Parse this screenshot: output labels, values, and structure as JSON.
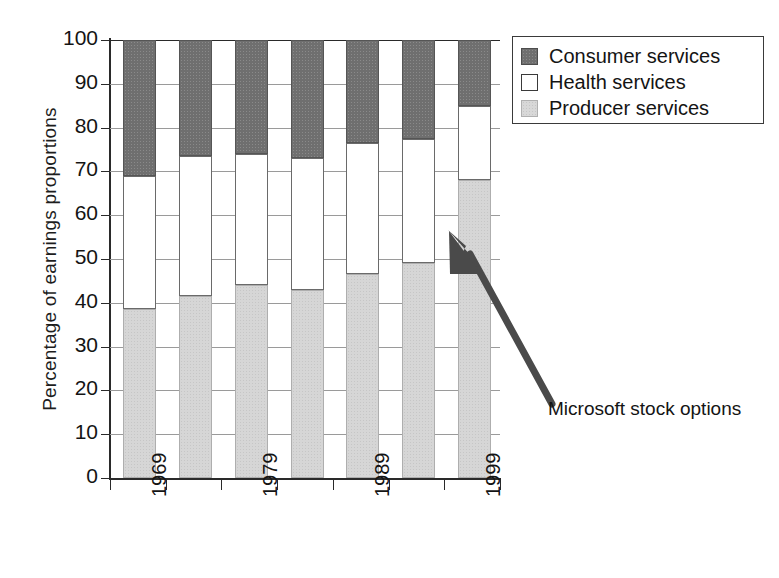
{
  "chart_data": {
    "type": "bar",
    "subtype": "stacked-100-percent",
    "title": "",
    "xlabel": "",
    "ylabel": "Percentage of earnings proportions",
    "ylim": [
      0,
      100
    ],
    "yticks": [
      0,
      10,
      20,
      30,
      40,
      50,
      60,
      70,
      80,
      90,
      100
    ],
    "grid": true,
    "legend_position": "top-right",
    "categories": [
      "1969",
      "1974",
      "1979",
      "1984",
      "1989",
      "1994",
      "1999"
    ],
    "tick_labels_shown": [
      "1969",
      "",
      "1979",
      "",
      "1989",
      "",
      "1999"
    ],
    "series": [
      {
        "name": "Producer services",
        "color": "#d6d6d6",
        "values": [
          38.5,
          41.5,
          44.0,
          43.0,
          46.5,
          49.0,
          68.0
        ]
      },
      {
        "name": "Health services",
        "color": "#ffffff",
        "values": [
          30.5,
          32.0,
          30.0,
          30.0,
          30.0,
          28.5,
          17.0
        ]
      },
      {
        "name": "Consumer services",
        "color": "#6f6f6f",
        "values": [
          31.0,
          26.5,
          26.0,
          27.0,
          23.5,
          22.5,
          15.0
        ]
      }
    ],
    "annotations": [
      {
        "text": "Microsoft stock options",
        "points_to_category": "1999",
        "points_to_series": "Producer services"
      }
    ]
  },
  "legend": {
    "entries": [
      {
        "label": "Consumer services",
        "swatch": "consumer-swatch"
      },
      {
        "label": "Health services",
        "swatch": "health-swatch"
      },
      {
        "label": "Producer services",
        "swatch": "producer-swatch"
      }
    ]
  },
  "axes": {
    "y_title": "Percentage of earnings proportions",
    "y_tick_labels": [
      "100",
      "90",
      "80",
      "70",
      "60",
      "50",
      "40",
      "30",
      "20",
      "10",
      "0"
    ],
    "x_tick_labels": [
      "1969",
      "1979",
      "1989",
      "1999"
    ]
  },
  "annotation": {
    "label": "Microsoft stock options"
  },
  "colors": {
    "consumer": "#6f6f6f",
    "health": "#ffffff",
    "producer": "#d6d6d6",
    "axis": "#2a2a2a",
    "grid": "#9a9a9a"
  }
}
